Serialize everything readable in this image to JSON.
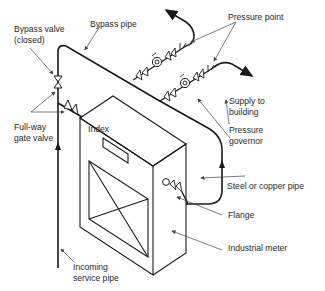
{
  "figure": {
    "labels": {
      "bypass_valve": "Bypass valve\n(closed)",
      "bypass_pipe": "Bypass pipe",
      "pressure_point": "Pressure point",
      "full_way_gate_valve": "Full-way\ngate valve",
      "index": "Index",
      "supply_to_building": "Supply to\nbuilding",
      "pressure_governor": "Pressure\ngovernor",
      "steel_or_copper_pipe": "Steel or copper pipe",
      "flange": "Flange",
      "industrial_meter": "Industrial meter",
      "incoming_service_pipe": "Incoming\nservice pipe"
    },
    "colors": {
      "line": "#1a1a1a",
      "leader": "#555555",
      "text": "#2a2a2a",
      "background": "#fefefe"
    }
  }
}
